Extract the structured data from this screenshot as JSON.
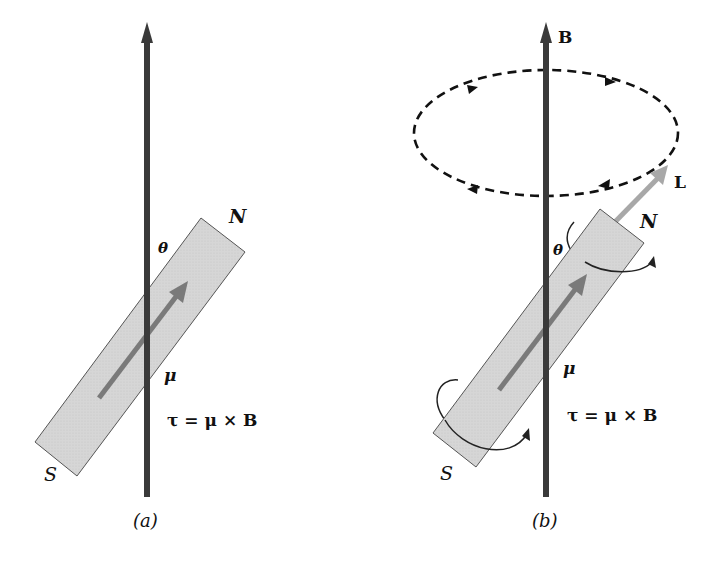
{
  "panels": [
    {
      "id": "a",
      "caption": "(a)",
      "labels": {
        "north": "N",
        "south": "S",
        "theta": "θ",
        "mu": "μ",
        "torque_equation": "τ = μ × B"
      }
    },
    {
      "id": "b",
      "caption": "(b)",
      "labels": {
        "field": "B",
        "angular_momentum": "L",
        "north": "N",
        "south": "S",
        "theta": "θ",
        "mu": "μ",
        "torque_equation": "τ = μ × B"
      }
    }
  ],
  "colors": {
    "axis": "#3a3a3a",
    "magnet_fill": "#d4d4d4",
    "magnet_stroke": "#555555",
    "mu_arrow": "#7a7a7a",
    "L_arrow": "#a8a8a8",
    "precession_path": "#111111",
    "text": "#111111"
  }
}
